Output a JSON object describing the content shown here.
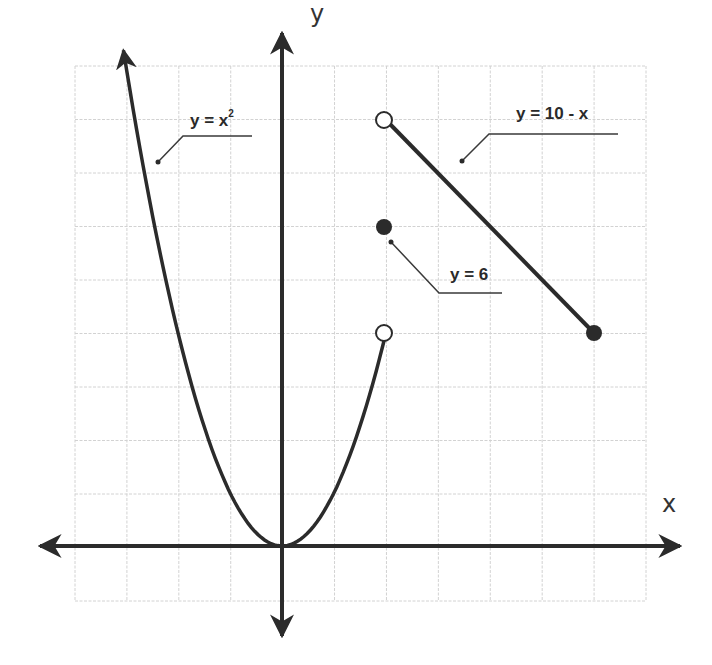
{
  "chart_data": {
    "type": "line",
    "title": "",
    "xlabel": "x",
    "ylabel": "y",
    "xlim": [
      -4,
      7
    ],
    "ylim": [
      -1,
      9
    ],
    "grid": true,
    "grid_unit": 1,
    "series": [
      {
        "name": "y = x²",
        "kind": "curve",
        "domain": [
          -3.05,
          2
        ],
        "left_end": "arrow",
        "right_end": {
          "x": 2,
          "y": 4,
          "marker": "open-circle"
        },
        "sample_points": [
          [
            -3,
            9
          ],
          [
            -2,
            4
          ],
          [
            -1,
            1
          ],
          [
            0,
            0
          ],
          [
            1,
            1
          ],
          [
            2,
            4
          ]
        ]
      },
      {
        "name": "y = 6",
        "kind": "point",
        "points": [
          {
            "x": 2,
            "y": 6,
            "marker": "filled-circle"
          }
        ]
      },
      {
        "name": "y = 10 - x",
        "kind": "segment",
        "start": {
          "x": 2,
          "y": 8,
          "marker": "open-circle"
        },
        "end": {
          "x": 6,
          "y": 4,
          "marker": "filled-circle"
        }
      }
    ],
    "annotations": [
      {
        "text": "y = x²",
        "target": "left branch of parabola"
      },
      {
        "text": "y = 10 - x",
        "target": "line segment"
      },
      {
        "text": "y = 6",
        "target": "filled point at (2, 6)"
      }
    ]
  },
  "axes": {
    "x_label": "x",
    "y_label": "y"
  },
  "labels": {
    "parabola_main": "y = x",
    "parabola_exp": "2",
    "line": "y = 10 - x",
    "point": "y = 6"
  },
  "colors": {
    "curve": "#2b2b2b",
    "grid": "#cfcfcf",
    "background": "#ffffff"
  }
}
